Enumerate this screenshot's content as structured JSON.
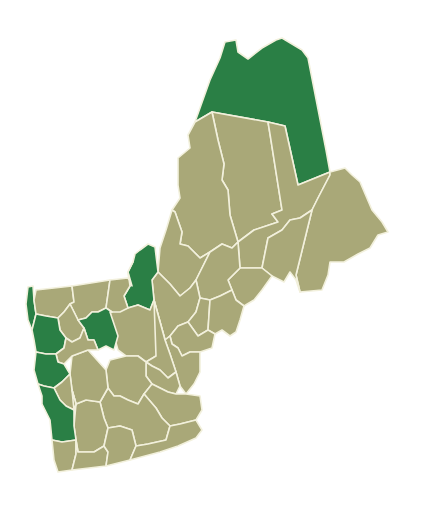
{
  "map": {
    "region": "Northern New England (Vermont, New Hampshire, Maine) counties",
    "colors": {
      "highlight": "#2a7f45",
      "base": "#a9a878",
      "border": "#f2f0dc",
      "background": "#ffffff"
    },
    "counties": [
      {
        "id": "aroostook",
        "category": "highlight",
        "points": "225,42 236,40 238,52 248,59 262,48 276,40 282,38 302,50 308,58 326,150 330,172 298,185 285,126 268,122 212,112 195,122 210,80 220,58"
      },
      {
        "id": "piscataquis",
        "category": "base",
        "points": "212,112 268,122 270,134 282,210 272,214 278,222 254,230 238,242 230,215 228,190 222,180 224,164 218,140"
      },
      {
        "id": "penobscot",
        "category": "base",
        "points": "268,122 285,126 298,185 330,172 330,175 318,198 312,210 300,218 290,220 282,230 268,238 262,268 240,268 238,242 254,230 278,222 272,214 282,210 270,134"
      },
      {
        "id": "somerset",
        "category": "base",
        "points": "195,122 212,112 218,140 224,164 222,180 228,190 230,215 238,242 232,248 222,244 210,252 200,258 188,246 180,244 182,232 175,212 172,210 180,198 178,185 178,158 190,148 188,135"
      },
      {
        "id": "washington",
        "category": "base",
        "points": "330,172 345,168 352,175 360,182 372,210 382,222 388,232 378,235 370,248 358,254 344,262 330,262 328,275 322,290 300,292 296,275 312,210 318,198 330,175"
      },
      {
        "id": "hancock",
        "category": "base",
        "points": "300,218 312,210 296,275 300,292 296,280 290,272 284,282 272,276 262,268 268,238 282,230 290,220"
      },
      {
        "id": "franklin-me",
        "category": "base",
        "points": "172,210 175,212 182,232 180,244 188,246 200,258 210,252 196,280 190,288 180,296 170,284 158,272 160,248 166,230"
      },
      {
        "id": "waldo-penobscot-south",
        "category": "base",
        "points": "240,268 262,268 272,276 262,290 254,300 244,306 236,300 232,290 228,280"
      },
      {
        "id": "kennebec",
        "category": "base",
        "points": "210,252 222,244 232,248 238,242 240,268 228,280 232,290 220,296 210,300 200,298 196,280"
      },
      {
        "id": "oxford",
        "category": "base",
        "points": "158,272 170,284 180,296 190,288 196,280 200,298 196,312 188,322 178,326 170,336 165,340 154,300 152,280"
      },
      {
        "id": "androscoggin",
        "category": "base",
        "points": "200,298 210,300 208,330 198,336 188,322 196,312"
      },
      {
        "id": "lincoln-knox",
        "category": "base",
        "points": "210,300 220,296 232,290 236,300 244,306 240,320 236,332 230,336 222,330 215,334 208,330"
      },
      {
        "id": "sagadahoc-cumberland",
        "category": "base",
        "points": "178,326 188,322 198,336 208,330 215,334 212,348 200,352 190,352 182,356 178,348 172,344 170,336"
      },
      {
        "id": "york",
        "category": "base",
        "points": "165,340 170,336 172,344 178,348 182,356 190,352 200,352 200,372 194,384 186,394 180,386 176,372 170,354"
      },
      {
        "id": "coos",
        "category": "highlight",
        "points": "140,250 148,244 155,247 158,272 152,280 154,300 150,310 138,305 128,308 124,296 130,286 128,272 133,262 135,254"
      },
      {
        "id": "grafton",
        "category": "base",
        "points": "128,308 138,305 150,310 154,300 165,340 156,356 146,362 138,356 126,356 118,350 114,336 112,322 110,312"
      },
      {
        "id": "carroll",
        "category": "base",
        "points": "154,300 165,340 170,354 176,372 168,378 160,370 152,366 146,362 156,356"
      },
      {
        "id": "belknap-strafford",
        "category": "base",
        "points": "146,362 152,366 160,370 168,378 176,372 180,386 176,394 168,392 160,388 152,384 146,376"
      },
      {
        "id": "merrimack",
        "category": "base",
        "points": "126,356 138,356 146,362 146,376 152,384 144,394 138,404 128,400 120,396 114,396 108,388 106,370 110,360"
      },
      {
        "id": "rockingham",
        "category": "base",
        "points": "152,384 160,388 168,392 176,394 186,394 200,396 202,410 196,420 180,424 170,426 162,418 156,408 144,394"
      },
      {
        "id": "hillsborough",
        "category": "base",
        "points": "108,388 114,396 120,396 128,400 138,404 144,394 156,408 162,418 170,426 166,440 148,444 136,446 132,430 120,426 108,428 104,418 100,402"
      },
      {
        "id": "cheshire",
        "category": "base",
        "points": "76,404 86,400 100,402 104,418 108,428 104,446 94,452 78,452 76,440 74,426"
      },
      {
        "id": "sullivan",
        "category": "base",
        "points": "72,356 88,350 106,370 108,388 100,402 86,400 76,404 72,390 70,374"
      },
      {
        "id": "grand-isle-franklin",
        "category": "highlight",
        "points": "28,287 33,286 34,300 36,314 34,322 32,330 28,320 26,304"
      },
      {
        "id": "franklin-vt",
        "category": "base",
        "points": "36,290 72,286 74,302 70,304 64,312 58,318 46,316 36,314 34,300"
      },
      {
        "id": "orleans",
        "category": "base",
        "points": "72,286 110,280 108,294 106,308 98,312 92,312 86,318 78,320 70,304 74,302"
      },
      {
        "id": "essex-vt",
        "category": "base",
        "points": "110,280 128,278 132,286 128,272 133,262 128,272 130,286 124,296 128,308 120,312 112,312 106,308 108,294"
      },
      {
        "id": "lamoille",
        "category": "base",
        "points": "64,312 70,304 78,320 84,328 80,338 72,342 66,338 60,330 58,318"
      },
      {
        "id": "caledonia",
        "category": "highlight",
        "points": "86,318 92,312 98,312 106,308 112,312 110,312 118,336 114,350 106,346 98,350 94,340 88,340 84,328 78,320"
      },
      {
        "id": "chittenden",
        "category": "highlight",
        "points": "36,314 46,316 58,318 60,330 66,338 64,348 56,354 46,354 36,352 34,340 32,330 34,322"
      },
      {
        "id": "washington-vt",
        "category": "base",
        "points": "66,338 72,342 80,338 84,328 88,340 94,340 98,350 88,350 72,356 64,364 58,362 56,354 64,348"
      },
      {
        "id": "addison",
        "category": "highlight",
        "points": "36,352 46,354 56,354 58,362 64,364 70,374 62,382 54,388 44,386 38,384 34,370"
      },
      {
        "id": "orange",
        "category": "base",
        "points": "70,374 72,390 76,404 74,410 66,406 60,400 56,392 54,388 62,382"
      },
      {
        "id": "rutland",
        "category": "highlight",
        "points": "38,384 44,386 54,388 56,392 60,400 66,406 74,410 74,426 76,440 62,442 52,440 50,420 42,404 42,396"
      },
      {
        "id": "windsor",
        "category": "base",
        "points": "72,390 76,404 74,410"
      },
      {
        "id": "bennington",
        "category": "base",
        "points": "52,440 62,442 76,440 76,454 72,470 58,472 54,460"
      },
      {
        "id": "windham",
        "category": "base",
        "points": "76,440 78,452 94,452 104,446 108,452 106,466 72,470 76,454"
      },
      {
        "id": "hillsborough-south",
        "category": "base",
        "points": "104,446 108,428 120,426 132,430 136,446 130,460 106,466 108,452"
      },
      {
        "id": "rockingham-south",
        "category": "base",
        "points": "136,446 148,444 166,440 170,426 180,424 196,420 202,430 196,438 178,446 160,452 130,460"
      }
    ]
  }
}
